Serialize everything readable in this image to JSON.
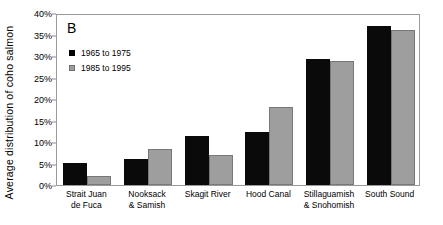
{
  "chart_data": {
    "type": "bar",
    "title": "",
    "panel_label": "B",
    "xlabel": "",
    "ylabel": "Average distribution of coho salmon",
    "ylim": [
      0,
      40
    ],
    "ytick_labels": [
      "0%",
      "5%",
      "10%",
      "15%",
      "20%",
      "25%",
      "30%",
      "35%",
      "40%"
    ],
    "ytick_values": [
      0,
      5,
      10,
      15,
      20,
      25,
      30,
      35,
      40
    ],
    "grid": false,
    "legend_position": "top-left",
    "value_suffix": "%",
    "categories": [
      "Strait Juan de Fuca",
      "Nooksack & Samish",
      "Skagit River",
      "Hood Canal",
      "Stillaguamish & Snohomish",
      "South Sound"
    ],
    "category_lines": [
      [
        "Strait Juan",
        "de Fuca"
      ],
      [
        "Nooksack",
        "& Samish"
      ],
      [
        "Skagit River"
      ],
      [
        "Hood Canal"
      ],
      [
        "Stillaguamish",
        "& Snohomish"
      ],
      [
        "South Sound"
      ]
    ],
    "series": [
      {
        "name": "1965 to 1975",
        "color": "#000000",
        "values": [
          5.2,
          6.0,
          11.4,
          12.4,
          29.3,
          36.9
        ]
      },
      {
        "name": "1985 to 1995",
        "color": "#9e9e9e",
        "values": [
          2.1,
          8.4,
          6.9,
          18.2,
          28.9,
          36.1
        ]
      }
    ]
  }
}
